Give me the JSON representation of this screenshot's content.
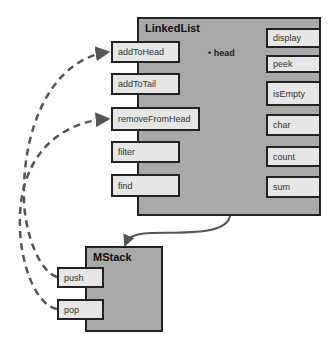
{
  "linked_list": {
    "title": "LinkedList",
    "field": "head",
    "left_methods": [
      "addToHead",
      "addToTail",
      "removeFromHead",
      "filter",
      "find"
    ],
    "right_methods": [
      "display",
      "peek",
      "isEmpty",
      "char",
      "count",
      "sum"
    ]
  },
  "mstack": {
    "title": "MStack",
    "methods": [
      "push",
      "pop"
    ]
  },
  "connections": [
    {
      "from": "MStack.push",
      "to": "LinkedList.addToHead",
      "style": "dashed"
    },
    {
      "from": "MStack.pop",
      "to": "LinkedList.removeFromHead",
      "style": "dashed"
    },
    {
      "from": "LinkedList",
      "to": "MStack",
      "style": "solid"
    }
  ]
}
